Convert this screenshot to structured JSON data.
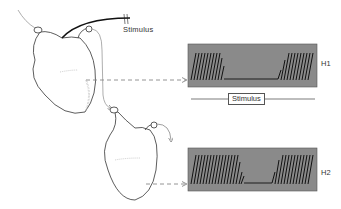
{
  "figure": {
    "stimulus_label_top": "Stimulus",
    "stimulus_bar_label": "Stimulus",
    "recordings": [
      {
        "id": "H1",
        "label": "H1",
        "trace": "oscillations, pause during stimulus, resume"
      },
      {
        "id": "H2",
        "label": "H2",
        "trace": "oscillations, delayed shorter pause, resume"
      }
    ],
    "colors": {
      "record_bg": "#8a8a8a",
      "trace": "#1a1a1a",
      "arrow": "#888888",
      "nerve": "#111111"
    }
  }
}
